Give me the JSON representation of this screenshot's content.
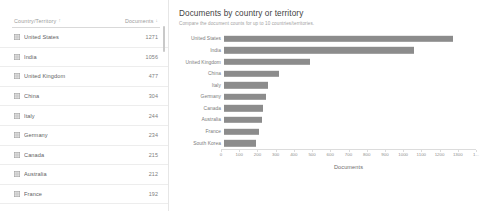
{
  "table": {
    "columns": [
      {
        "label": "Country/Territory",
        "sort_indicator": "↑"
      },
      {
        "label": "Documents",
        "sort_indicator": "↓"
      }
    ],
    "row_icon": "grid-icon",
    "rows": [
      {
        "country": "United States",
        "documents": "1271"
      },
      {
        "country": "India",
        "documents": "1056"
      },
      {
        "country": "United Kingdom",
        "documents": "477"
      },
      {
        "country": "China",
        "documents": "304"
      },
      {
        "country": "Italy",
        "documents": "244"
      },
      {
        "country": "Germany",
        "documents": "234"
      },
      {
        "country": "Canada",
        "documents": "215"
      },
      {
        "country": "Australia",
        "documents": "212"
      },
      {
        "country": "France",
        "documents": "192"
      }
    ]
  },
  "chart": {
    "title": "Documents by country or territory",
    "subtitle": "Compare the document counts for up to 10 countries/territories."
  },
  "chart_data": {
    "type": "bar",
    "orientation": "horizontal",
    "title": "Documents by country or territory",
    "subtitle": "Compare the document counts for up to 10 countries/territories.",
    "xlabel": "Documents",
    "ylabel": "",
    "categories": [
      "United States",
      "India",
      "United Kingdom",
      "China",
      "Italy",
      "Germany",
      "Canada",
      "Australia",
      "France",
      "South Korea"
    ],
    "values": [
      1271,
      1056,
      477,
      304,
      244,
      234,
      215,
      212,
      192,
      178
    ],
    "xlim": [
      0,
      1400
    ],
    "xticks": [
      0,
      100,
      200,
      300,
      400,
      500,
      600,
      700,
      800,
      900,
      1000,
      1100,
      1200,
      1300,
      1400
    ],
    "xticklabels": [
      "0",
      "100",
      "200",
      "300",
      "400",
      "500",
      "600",
      "700",
      "800",
      "900",
      "1000",
      "1100",
      "1200",
      "1300",
      "1..."
    ],
    "grid": false,
    "legend": false,
    "bar_color": "#8c8c8c"
  }
}
